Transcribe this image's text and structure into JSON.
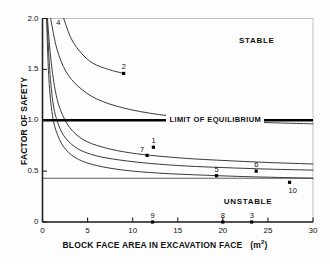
{
  "chart_data": {
    "type": "line",
    "title": "",
    "xlabel": "BLOCK FACE AREA  IN EXCAVATION FACE   (m2)",
    "xlabel_main": "BLOCK FACE AREA  IN EXCAVATION FACE",
    "xlabel_unit": "m",
    "xlabel_unit_sup": "2",
    "ylabel": "FACTOR OF SAFETY",
    "xlim": [
      0,
      30
    ],
    "ylim": [
      0,
      2.0
    ],
    "xticks": [
      0,
      5,
      10,
      15,
      20,
      25,
      30
    ],
    "xtick_labels": [
      "0",
      "5",
      "10",
      "15",
      "20",
      "25",
      "30"
    ],
    "yticks": [
      0,
      0.5,
      1.0,
      1.5,
      2.0
    ],
    "ytick_labels": [
      "0",
      "0.5",
      "1.0",
      "1.5",
      "2.0"
    ],
    "grid": false,
    "legend_position": "none",
    "annotations": [
      {
        "text": "STABLE",
        "x": 24.9,
        "y": 1.79
      },
      {
        "text": "UNSTABLE",
        "x": 23.2,
        "y": 0.21
      },
      {
        "text": "LIMIT OF EQUILIBRIUM",
        "x": 22.4,
        "y": 1.0
      }
    ],
    "reference_lines": [
      {
        "name": "limit-of-equilibrium",
        "y": 1.0,
        "style": "thick-solid",
        "color": "#000000"
      },
      {
        "name": "residual-strength",
        "y": 0.43,
        "style": "thin-solid",
        "color": "#333333"
      }
    ],
    "series": [
      {
        "name": "curve-a",
        "points": [
          [
            0.55,
            2.0
          ],
          [
            0.9,
            1.62
          ],
          [
            1.4,
            1.3
          ],
          [
            2.0,
            1.1
          ],
          [
            3.0,
            0.93
          ],
          [
            4.5,
            0.81
          ],
          [
            6.5,
            0.74
          ],
          [
            9.0,
            0.69
          ],
          [
            12.0,
            0.655
          ],
          [
            16.0,
            0.625
          ],
          [
            20.0,
            0.605
          ],
          [
            25.0,
            0.585
          ],
          [
            30.0,
            0.57
          ]
        ]
      },
      {
        "name": "curve-b",
        "points": [
          [
            0.5,
            2.0
          ],
          [
            0.8,
            1.5
          ],
          [
            1.2,
            1.15
          ],
          [
            1.8,
            0.95
          ],
          [
            2.6,
            0.82
          ],
          [
            4.0,
            0.715
          ],
          [
            6.0,
            0.65
          ],
          [
            8.5,
            0.61
          ],
          [
            12.0,
            0.575
          ],
          [
            16.0,
            0.55
          ],
          [
            20.0,
            0.535
          ],
          [
            25.0,
            0.52
          ],
          [
            30.0,
            0.51
          ]
        ]
      },
      {
        "name": "curve-c",
        "points": [
          [
            0.45,
            2.0
          ],
          [
            0.7,
            1.42
          ],
          [
            1.1,
            1.05
          ],
          [
            1.7,
            0.85
          ],
          [
            2.6,
            0.71
          ],
          [
            4.0,
            0.615
          ],
          [
            6.0,
            0.555
          ],
          [
            9.0,
            0.51
          ],
          [
            13.0,
            0.48
          ],
          [
            18.0,
            0.46
          ],
          [
            23.0,
            0.445
          ],
          [
            30.0,
            0.43
          ]
        ]
      },
      {
        "name": "curve-d",
        "points": [
          [
            2.35,
            2.0
          ],
          [
            3.2,
            1.8
          ],
          [
            4.3,
            1.66
          ],
          [
            5.6,
            1.56
          ],
          [
            7.3,
            1.5
          ],
          [
            9.0,
            1.46
          ]
        ]
      },
      {
        "name": "curve-e",
        "points": [
          [
            0.9,
            2.0
          ],
          [
            1.6,
            1.7
          ],
          [
            2.6,
            1.48
          ],
          [
            4.0,
            1.33
          ],
          [
            6.0,
            1.21
          ],
          [
            9.0,
            1.12
          ],
          [
            13.0,
            1.055
          ],
          [
            18.0,
            1.01
          ],
          [
            24.0,
            0.98
          ],
          [
            30.0,
            0.965
          ]
        ]
      }
    ],
    "data_points": [
      {
        "label": "4",
        "x": 1.75,
        "y": 1.92,
        "marker": false,
        "label_dx": -2,
        "label_dy": -9
      },
      {
        "label": "2",
        "x": 9.0,
        "y": 1.46,
        "marker": true,
        "label_dx": -2,
        "label_dy": -11
      },
      {
        "label": "1",
        "x": 12.3,
        "y": 0.735,
        "marker": true,
        "label_dx": -2,
        "label_dy": -11
      },
      {
        "label": "7",
        "x": 11.6,
        "y": 0.655,
        "marker": true,
        "label_dx": -7,
        "label_dy": -10
      },
      {
        "label": "5",
        "x": 19.3,
        "y": 0.455,
        "marker": true,
        "label_dx": -2,
        "label_dy": -11
      },
      {
        "label": "6",
        "x": 23.7,
        "y": 0.5,
        "marker": true,
        "label_dx": -2,
        "label_dy": -11
      },
      {
        "label": "10",
        "x": 27.4,
        "y": 0.39,
        "marker": true,
        "label_dx": -1,
        "label_dy": 4
      },
      {
        "label": "9",
        "x": 12.2,
        "y": 0.0,
        "marker": true,
        "label_dx": -2,
        "label_dy": -11
      },
      {
        "label": "8",
        "x": 20.0,
        "y": 0.0,
        "marker": true,
        "label_dx": -2,
        "label_dy": -11
      },
      {
        "label": "3",
        "x": 23.2,
        "y": 0.0,
        "marker": true,
        "label_dx": -2,
        "label_dy": -11
      }
    ],
    "colors": {
      "curve": "#3a3a3a",
      "axis": "#222222",
      "frame": "#b9b9b9",
      "limit_line": "#000000",
      "text": "#111111",
      "background": "#fdfdfd"
    }
  }
}
